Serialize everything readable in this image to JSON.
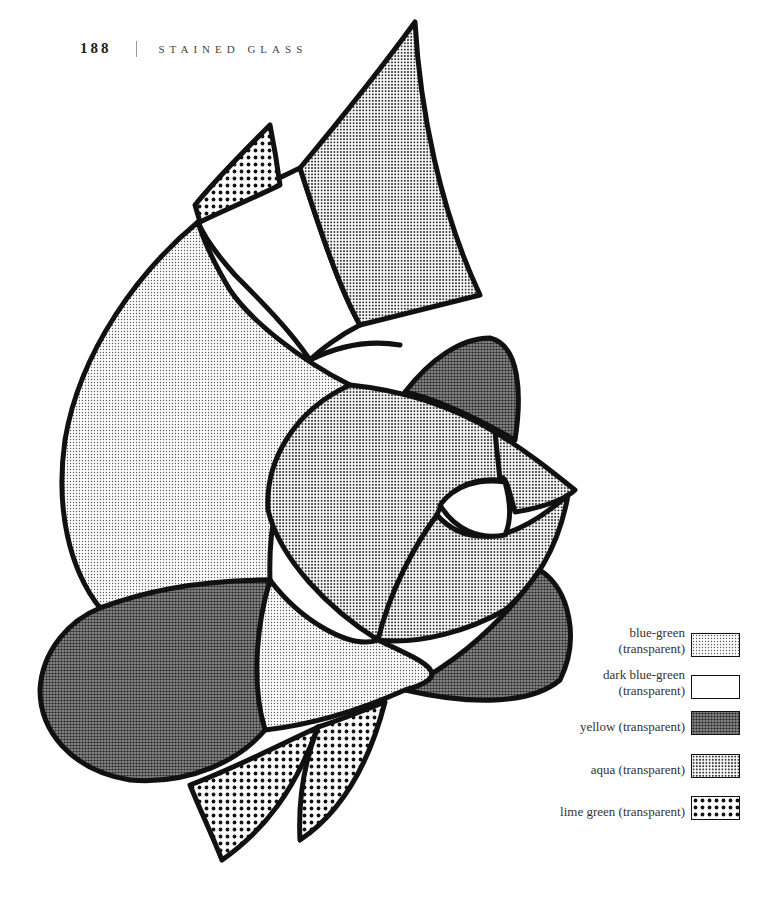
{
  "header": {
    "page_number": "188",
    "running_title": "STAINED GLASS"
  },
  "figure": {
    "regions": [
      {
        "name": "top-right-leaf",
        "glass": "aqua"
      },
      {
        "name": "top-left-small-leaf",
        "glass": "lime green"
      },
      {
        "name": "banner-white",
        "glass": "dark blue-green"
      },
      {
        "name": "large-left-petal",
        "glass": "blue-green"
      },
      {
        "name": "rose-center-left",
        "glass": "aqua"
      },
      {
        "name": "rose-center-right",
        "glass": "aqua"
      },
      {
        "name": "rose-tip",
        "glass": "aqua"
      },
      {
        "name": "rose-eye",
        "glass": "dark blue-green"
      },
      {
        "name": "upper-right-petal",
        "glass": "yellow"
      },
      {
        "name": "lower-right-petal",
        "glass": "yellow"
      },
      {
        "name": "large-lower-left-petal",
        "glass": "yellow"
      },
      {
        "name": "lower-center-petal",
        "glass": "blue-green"
      },
      {
        "name": "bottom-leaf-left",
        "glass": "lime green"
      },
      {
        "name": "bottom-leaf-right",
        "glass": "lime green"
      }
    ]
  },
  "legend": {
    "items": [
      {
        "label_line1": "blue-green",
        "label_line2": "(transparent)",
        "pattern": "fine-dots"
      },
      {
        "label_line1": "dark blue-green",
        "label_line2": "(transparent)",
        "pattern": "none"
      },
      {
        "label_line1": "",
        "label_line2": "yellow (transparent)",
        "pattern": "dense-dots"
      },
      {
        "label_line1": "",
        "label_line2": "aqua (transparent)",
        "pattern": "medium-dots"
      },
      {
        "label_line1": "",
        "label_line2": "lime green (transparent)",
        "pattern": "large-dots"
      }
    ]
  },
  "colors": {
    "lead_line": "#111111",
    "paper": "#ffffff"
  }
}
